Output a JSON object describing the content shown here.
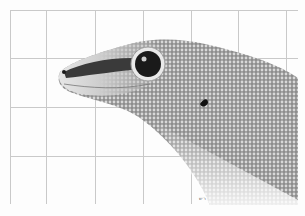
{
  "image": {
    "subject": "Gecko head in profile over a grid background",
    "tones": {
      "background": "#fdfdfd",
      "grid": "#c9c9c9",
      "skin_light": "#d9d9d9",
      "skin_mid": "#9a9a9a",
      "skin_dark": "#3a3a3a",
      "eye_dark": "#1a1a1a"
    },
    "grid": {
      "vertical_x": [
        10,
        46,
        95,
        143,
        191,
        238,
        286
      ],
      "horizontal_y": [
        10,
        58,
        107,
        156
      ],
      "top": 10,
      "bottom": 204,
      "left": 10,
      "right": 298
    },
    "caption": "ר׳ש"
  }
}
